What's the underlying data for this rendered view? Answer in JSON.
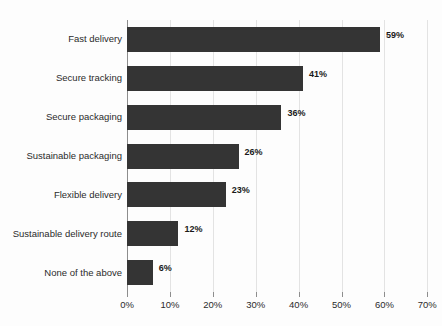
{
  "chart_data": {
    "type": "bar",
    "orientation": "horizontal",
    "title": "",
    "xlabel": "",
    "ylabel": "",
    "categories": [
      "Fast delivery",
      "Secure tracking",
      "Secure packaging",
      "Sustainable packaging",
      "Flexible delivery",
      "Sustainable delivery route",
      "None of the above"
    ],
    "values": [
      59,
      41,
      36,
      26,
      23,
      12,
      6
    ],
    "value_labels": [
      "59%",
      "41%",
      "36%",
      "26%",
      "23%",
      "12%",
      "6%"
    ],
    "xlim": [
      0,
      70
    ],
    "xticks": [
      0,
      10,
      20,
      30,
      40,
      50,
      60,
      70
    ],
    "xtick_labels": [
      "0%",
      "10%",
      "20%",
      "30%",
      "40%",
      "50%",
      "60%",
      "70%"
    ],
    "grid": true,
    "grid_axis": "x",
    "legend": null,
    "bar_color": "#343434",
    "gridline_color": "#e3e3e3",
    "axis_color": "#8d8d8d",
    "background_color": "#fdfdfd",
    "text_color": "#2b2b2b"
  }
}
